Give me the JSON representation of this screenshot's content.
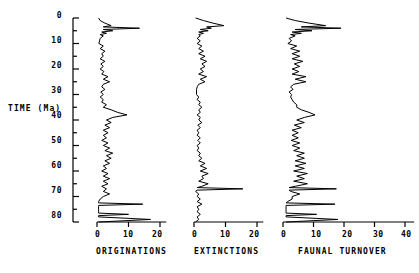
{
  "figure": {
    "background": "#ffffff",
    "line_color": "#000000",
    "axis_color": "#000000"
  },
  "yaxis": {
    "label": "TIME (Ma)",
    "min": 0,
    "max": 80,
    "inverted": true,
    "tick_labels": [
      "0",
      "10",
      "20",
      "30",
      "40",
      "50",
      "60",
      "70",
      "80"
    ],
    "tick_values": [
      0,
      10,
      20,
      30,
      40,
      50,
      60,
      70,
      80
    ],
    "minor_tick_step": 5
  },
  "chart_data": [
    {
      "type": "line",
      "title": "ORIGINATIONS",
      "xlabel": "ORIGINATIONS",
      "ylabel": "TIME (Ma)",
      "orientation": "horizontal-value-vertical-time",
      "xlim": [
        0,
        22
      ],
      "ylim": [
        0,
        80
      ],
      "xtick_labels": [
        "0",
        "10",
        "20"
      ],
      "xtick_values": [
        0,
        10,
        20
      ],
      "grid": false,
      "legend": "none",
      "x": [
        0.0,
        1.0,
        2.0,
        3.0,
        3.5,
        4.0,
        4.5,
        5.0,
        5.5,
        6.0,
        6.5,
        7.0,
        8.0,
        9.0,
        10.0,
        11.0,
        12.0,
        13.0,
        14.0,
        15.0,
        16.0,
        17.0,
        18.0,
        19.0,
        20.0,
        21.0,
        22.0,
        23.0,
        24.0,
        25.0,
        26.0,
        27.0,
        28.0,
        29.0,
        30.0,
        31.0,
        32.0,
        33.0,
        34.0,
        35.0,
        36.0,
        37.0,
        38.0,
        39.0,
        40.0,
        41.0,
        42.0,
        43.0,
        44.0,
        45.0,
        46.0,
        47.0,
        48.0,
        49.0,
        50.0,
        51.0,
        52.0,
        53.0,
        54.0,
        55.0,
        56.0,
        57.0,
        58.0,
        59.0,
        60.0,
        61.0,
        62.0,
        63.0,
        64.0,
        65.0,
        66.0,
        67.0,
        68.0,
        69.0,
        70.0,
        71.0,
        72.0,
        72.5,
        73.0,
        73.5,
        74.0,
        75.0,
        76.0,
        76.5,
        77.0,
        77.5,
        78.0,
        79.0,
        80.0
      ],
      "values": [
        0.5,
        1.0,
        2.5,
        4.5,
        2.0,
        13.5,
        2.0,
        5.0,
        1.5,
        3.0,
        1.0,
        2.0,
        1.0,
        0.8,
        0.6,
        2.0,
        1.0,
        2.5,
        1.5,
        2.0,
        1.0,
        2.5,
        1.2,
        2.0,
        1.0,
        2.2,
        1.5,
        3.5,
        2.0,
        4.0,
        2.0,
        1.5,
        2.5,
        1.2,
        2.0,
        1.0,
        2.0,
        1.5,
        3.0,
        2.0,
        4.5,
        6.5,
        9.5,
        5.0,
        3.0,
        4.5,
        2.5,
        4.0,
        2.0,
        3.5,
        2.0,
        3.0,
        1.5,
        3.5,
        2.0,
        4.0,
        2.5,
        5.0,
        3.0,
        4.5,
        2.5,
        4.0,
        2.0,
        3.0,
        1.5,
        3.5,
        2.0,
        4.0,
        2.0,
        3.5,
        1.5,
        3.0,
        2.0,
        4.0,
        2.0,
        1.0,
        0.5,
        0.5,
        14.5,
        0.5,
        0.5,
        0.5,
        0.5,
        0.5,
        10.0,
        0.5,
        0.5,
        17.0,
        0.5
      ]
    },
    {
      "type": "line",
      "title": "EXTINCTIONS",
      "xlabel": "EXTINCTIONS",
      "ylabel": "TIME (Ma)",
      "orientation": "horizontal-value-vertical-time",
      "xlim": [
        0,
        22
      ],
      "ylim": [
        0,
        80
      ],
      "xtick_labels": [
        "0",
        "10",
        "20"
      ],
      "xtick_values": [
        0,
        10,
        20
      ],
      "grid": false,
      "legend": "none",
      "x": [
        0.0,
        1.0,
        2.0,
        3.0,
        3.5,
        4.0,
        4.5,
        5.0,
        5.5,
        6.0,
        6.5,
        7.0,
        8.0,
        9.0,
        10.0,
        11.0,
        12.0,
        13.0,
        14.0,
        15.0,
        16.0,
        17.0,
        18.0,
        19.0,
        20.0,
        21.0,
        22.0,
        23.0,
        24.0,
        25.0,
        26.0,
        27.0,
        28.0,
        29.0,
        30.0,
        31.0,
        32.0,
        33.0,
        34.0,
        35.0,
        36.0,
        37.0,
        38.0,
        39.0,
        40.0,
        41.0,
        42.0,
        43.0,
        44.0,
        45.0,
        46.0,
        47.0,
        48.0,
        49.0,
        50.0,
        51.0,
        52.0,
        53.0,
        54.0,
        55.0,
        56.0,
        57.0,
        58.0,
        59.0,
        60.0,
        61.0,
        62.0,
        63.0,
        64.0,
        65.0,
        66.0,
        66.5,
        67.0,
        67.5,
        68.0,
        69.0,
        70.0,
        71.0,
        72.0,
        73.0,
        74.0,
        75.0,
        76.0,
        77.0,
        78.0,
        79.0,
        80.0
      ],
      "values": [
        0.5,
        3.0,
        6.0,
        9.5,
        4.0,
        5.5,
        2.0,
        4.5,
        1.5,
        3.0,
        1.5,
        2.0,
        1.0,
        2.0,
        1.0,
        2.5,
        1.5,
        3.0,
        1.5,
        3.5,
        2.0,
        4.0,
        2.5,
        3.5,
        2.0,
        3.0,
        1.5,
        4.0,
        2.0,
        3.5,
        1.5,
        1.0,
        0.8,
        0.8,
        0.8,
        1.5,
        1.0,
        2.0,
        1.5,
        2.5,
        1.5,
        2.0,
        1.0,
        2.0,
        1.5,
        2.5,
        1.2,
        2.0,
        1.0,
        1.5,
        1.0,
        2.0,
        1.2,
        2.0,
        1.0,
        1.5,
        1.0,
        2.0,
        1.5,
        2.5,
        1.5,
        3.5,
        2.0,
        4.0,
        2.0,
        4.5,
        2.5,
        3.0,
        1.5,
        4.5,
        2.5,
        1.0,
        15.5,
        1.0,
        0.5,
        1.5,
        1.0,
        2.0,
        1.0,
        2.5,
        1.0,
        1.5,
        1.0,
        2.0,
        1.0,
        1.5,
        0.5
      ]
    },
    {
      "type": "line",
      "title": "FAUNAL TURNOVER",
      "xlabel": "FAUNAL TURNOVER",
      "ylabel": "TIME (Ma)",
      "orientation": "horizontal-value-vertical-time",
      "xlim": [
        0,
        43
      ],
      "ylim": [
        0,
        80
      ],
      "xtick_labels": [
        "0",
        "10",
        "20",
        "30",
        "40"
      ],
      "xtick_values": [
        0,
        10,
        20,
        30,
        40
      ],
      "grid": false,
      "legend": "none",
      "x": [
        0.0,
        1.0,
        2.0,
        3.0,
        3.5,
        4.0,
        4.5,
        5.0,
        5.5,
        6.0,
        6.5,
        7.0,
        8.0,
        9.0,
        10.0,
        11.0,
        12.0,
        13.0,
        14.0,
        15.0,
        16.0,
        17.0,
        18.0,
        19.0,
        20.0,
        21.0,
        22.0,
        23.0,
        24.0,
        25.0,
        26.0,
        27.0,
        28.0,
        29.0,
        30.0,
        31.0,
        32.0,
        33.0,
        34.0,
        35.0,
        36.0,
        37.0,
        38.0,
        39.0,
        40.0,
        41.0,
        42.0,
        43.0,
        44.0,
        45.0,
        46.0,
        47.0,
        48.0,
        49.0,
        50.0,
        51.0,
        52.0,
        53.0,
        54.0,
        55.0,
        56.0,
        57.0,
        58.0,
        59.0,
        60.0,
        61.0,
        62.0,
        63.0,
        64.0,
        65.0,
        66.0,
        66.5,
        67.0,
        67.5,
        68.0,
        69.0,
        70.0,
        71.0,
        72.0,
        72.5,
        73.0,
        73.5,
        74.0,
        75.0,
        76.0,
        76.5,
        77.0,
        77.5,
        78.0,
        79.0,
        80.0
      ],
      "values": [
        1.0,
        4.0,
        8.5,
        14.0,
        6.0,
        19.0,
        4.0,
        9.5,
        3.0,
        6.0,
        2.5,
        4.0,
        2.0,
        2.8,
        1.6,
        4.5,
        2.5,
        5.5,
        3.0,
        5.5,
        3.0,
        6.5,
        3.7,
        5.5,
        3.0,
        5.2,
        3.0,
        7.5,
        4.0,
        7.5,
        3.5,
        2.5,
        3.3,
        2.0,
        2.8,
        2.5,
        3.0,
        3.5,
        4.5,
        4.5,
        6.0,
        8.5,
        10.5,
        7.0,
        4.5,
        7.0,
        3.7,
        6.0,
        3.0,
        5.0,
        3.0,
        5.0,
        2.7,
        5.5,
        3.0,
        5.5,
        3.5,
        7.0,
        4.5,
        7.0,
        4.0,
        7.5,
        4.0,
        7.0,
        3.5,
        8.0,
        4.5,
        7.0,
        3.5,
        8.0,
        4.0,
        2.0,
        17.5,
        2.0,
        2.5,
        5.5,
        3.0,
        3.0,
        1.5,
        1.0,
        17.0,
        1.0,
        1.0,
        1.0,
        1.0,
        1.0,
        11.0,
        1.0,
        1.0,
        18.0,
        1.0
      ]
    }
  ]
}
